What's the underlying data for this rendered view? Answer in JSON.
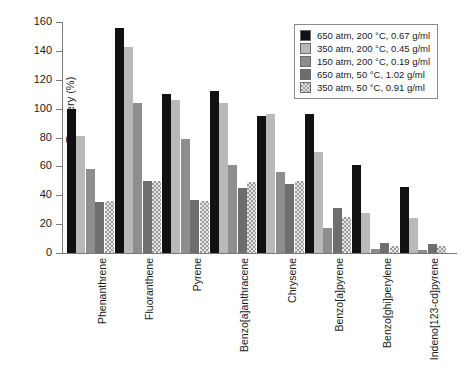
{
  "chart_data": {
    "type": "bar",
    "title": "",
    "xlabel": "",
    "ylabel": "Recovery (%)",
    "ylim": [
      0,
      160
    ],
    "ytick_labels": [
      "0",
      "20",
      "40",
      "60",
      "80",
      "100",
      "120",
      "140",
      "160"
    ],
    "ytick_values": [
      0,
      20,
      40,
      60,
      80,
      100,
      120,
      140,
      160
    ],
    "grid": false,
    "legend_position": "top-right",
    "categories": [
      "Phenanthrene",
      "Fluoranthene",
      "Pyrene",
      "Benzo[a]anthracene",
      "Chrysene",
      "Benzo[a]pyrene",
      "Benzo[ghi]perylene",
      "Indeno[123-cd]pyrene"
    ],
    "series": [
      {
        "name": "650 atm, 200 °C, 0.67 g/ml",
        "color": "#111111",
        "values": [
          100,
          156,
          110,
          112,
          95,
          96,
          61,
          46
        ]
      },
      {
        "name": "350 atm, 200 °C, 0.45 g/ml",
        "color": "#b9b9b9",
        "values": [
          81,
          143,
          106,
          104,
          96,
          70,
          28,
          24
        ]
      },
      {
        "name": "150 atm, 200 °C, 0.19 g/ml",
        "color": "#8e8e8e",
        "values": [
          58,
          104,
          79,
          61,
          56,
          17,
          3,
          2
        ]
      },
      {
        "name": "650 atm, 50 °C, 1.02 g/ml",
        "color": "#6e6e6e",
        "values": [
          35,
          50,
          37,
          45,
          48,
          31,
          7,
          6
        ]
      },
      {
        "name": "350 atm, 50 °C, 0.91 g/ml",
        "color": "#e8e8e8",
        "values": [
          36,
          50,
          36,
          49,
          50,
          25,
          5,
          5
        ]
      }
    ]
  }
}
